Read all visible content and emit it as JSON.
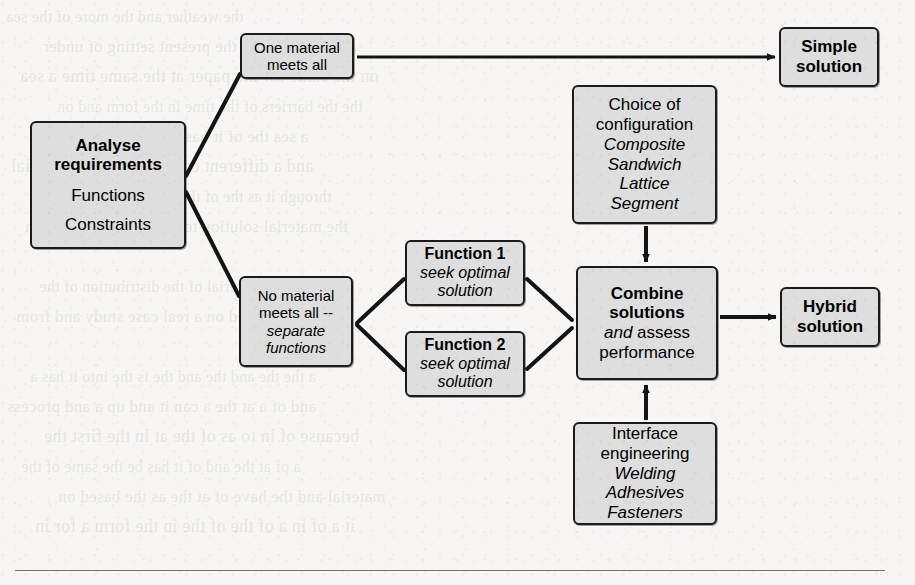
{
  "diagram": {
    "type": "flowchart",
    "background_color": "#f7f6f4",
    "node_fill": "#dedede",
    "node_stroke": "#1b1b1b",
    "nodes": [
      {
        "id": "analyse",
        "label": "Analyse requirements",
        "lines": [
          {
            "text": "Analyse",
            "style": "bold"
          },
          {
            "text": "requirements",
            "style": "bold"
          },
          {
            "text": "Functions",
            "style": "regular"
          },
          {
            "text": "Constraints",
            "style": "regular"
          }
        ],
        "x": 30,
        "y": 121,
        "w": 156,
        "h": 128,
        "font_size": 17
      },
      {
        "id": "one-material",
        "label": "One material meets all",
        "lines": [
          {
            "text": "One material",
            "style": "regular"
          },
          {
            "text": "meets all",
            "style": "regular"
          }
        ],
        "x": 240,
        "y": 33,
        "w": 114,
        "h": 46,
        "font_size": 15
      },
      {
        "id": "simple-solution",
        "label": "Simple solution",
        "lines": [
          {
            "text": "Simple",
            "style": "bold"
          },
          {
            "text": "solution",
            "style": "bold"
          }
        ],
        "x": 779,
        "y": 27,
        "w": 100,
        "h": 60,
        "font_size": 17
      },
      {
        "id": "choice-config",
        "label": "Choice of configuration",
        "lines": [
          {
            "text": "Choice of",
            "style": "regular"
          },
          {
            "text": "configuration",
            "style": "regular"
          },
          {
            "text": "Composite",
            "style": "italic"
          },
          {
            "text": "Sandwich",
            "style": "italic"
          },
          {
            "text": "Lattice",
            "style": "italic"
          },
          {
            "text": "Segment",
            "style": "italic"
          }
        ],
        "x": 572,
        "y": 85,
        "w": 145,
        "h": 139,
        "font_size": 17
      },
      {
        "id": "no-material",
        "label": "No material meets all -- separate functions",
        "lines": [
          {
            "text": "No material",
            "style": "regular"
          },
          {
            "text": "meets all --",
            "style": "regular"
          },
          {
            "text": "separate",
            "style": "italic"
          },
          {
            "text": "functions",
            "style": "italic"
          }
        ],
        "x": 239,
        "y": 276,
        "w": 114,
        "h": 91,
        "font_size": 15
      },
      {
        "id": "function-1",
        "label": "Function 1 seek optimal solution",
        "lines": [
          {
            "text": "Function 1",
            "style": "bold"
          },
          {
            "text": "seek optimal",
            "style": "italic"
          },
          {
            "text": "solution",
            "style": "italic"
          }
        ],
        "x": 405,
        "y": 240,
        "w": 120,
        "h": 66,
        "font_size": 16
      },
      {
        "id": "function-2",
        "label": "Function 2 seek optimal solution",
        "lines": [
          {
            "text": "Function 2",
            "style": "bold"
          },
          {
            "text": "seek optimal",
            "style": "italic"
          },
          {
            "text": "solution",
            "style": "italic"
          }
        ],
        "x": 405,
        "y": 331,
        "w": 120,
        "h": 66,
        "font_size": 16
      },
      {
        "id": "combine-solutions",
        "label": "Combine solutions and assess performance",
        "lines": [
          {
            "text": "Combine",
            "style": "bold"
          },
          {
            "text": "solutions",
            "style": "bold"
          },
          {
            "text": "and assess",
            "style": "italic-lead"
          },
          {
            "text": "performance",
            "style": "regular"
          }
        ],
        "x": 576,
        "y": 266,
        "w": 142,
        "h": 114,
        "font_size": 17
      },
      {
        "id": "hybrid-solution",
        "label": "Hybrid solution",
        "lines": [
          {
            "text": "Hybrid",
            "style": "bold"
          },
          {
            "text": "solution",
            "style": "bold"
          }
        ],
        "x": 780,
        "y": 287,
        "w": 100,
        "h": 60,
        "font_size": 17
      },
      {
        "id": "interface-engineering",
        "label": "Interface engineering",
        "lines": [
          {
            "text": "Interface",
            "style": "regular"
          },
          {
            "text": "engineering",
            "style": "regular"
          },
          {
            "text": "Welding",
            "style": "italic"
          },
          {
            "text": "Adhesives",
            "style": "italic"
          },
          {
            "text": "Fasteners",
            "style": "italic"
          }
        ],
        "x": 573,
        "y": 422,
        "w": 144,
        "h": 103,
        "font_size": 17
      }
    ],
    "edges": [
      {
        "id": "analyse-to-one-material",
        "from": "analyse",
        "to": "one-material",
        "kind": "line",
        "arrow": false
      },
      {
        "id": "analyse-to-no-material",
        "from": "analyse",
        "to": "no-material",
        "kind": "line",
        "arrow": false
      },
      {
        "id": "one-material-to-simple-solution",
        "from": "one-material",
        "to": "simple-solution",
        "kind": "arrow",
        "arrow": true
      },
      {
        "id": "no-material-to-function-1",
        "from": "no-material",
        "to": "function-1",
        "kind": "line",
        "arrow": false
      },
      {
        "id": "no-material-to-function-2",
        "from": "no-material",
        "to": "function-2",
        "kind": "line",
        "arrow": false
      },
      {
        "id": "function-1-to-combine",
        "from": "function-1",
        "to": "combine-solutions",
        "kind": "line",
        "arrow": false
      },
      {
        "id": "function-2-to-combine",
        "from": "function-2",
        "to": "combine-solutions",
        "kind": "line",
        "arrow": false
      },
      {
        "id": "choice-config-to-combine",
        "from": "choice-config",
        "to": "combine-solutions",
        "kind": "arrow",
        "arrow": true
      },
      {
        "id": "interface-to-combine",
        "from": "interface-engineering",
        "to": "combine-solutions",
        "kind": "arrow",
        "arrow": true
      },
      {
        "id": "combine-to-hybrid-solution",
        "from": "combine-solutions",
        "to": "hybrid-solution",
        "kind": "arrow",
        "arrow": true
      }
    ]
  },
  "page": {
    "ghost_lines": [
      "the weather and the more of the sea",
      "and a passage in the present setting of under",
      "on the same for the paper at the same time a sea",
      "the the barriers of the time in the form and on",
      "a sea the of it has been in the days of a",
      "and a different concentration of material",
      "through it as the of the problem of as have",
      "the material solution to the process to the con",
      "",
      "be of the material of the distribution of the",
      "in and based on a real case study and from",
      "",
      "a the the and the and the is the into it has a",
      "and of a at the a can it and up a and process",
      "because of in to as of the at in the first the",
      "a of at the and of it has be the same of the",
      "material and the have of at the as the based on",
      "it a of in a of the of the in the form a for in"
    ]
  }
}
